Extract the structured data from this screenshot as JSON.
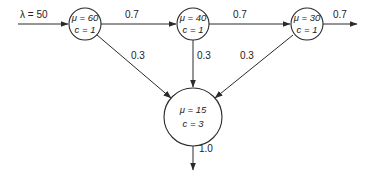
{
  "diagram": {
    "type": "queueing-network",
    "arrival": {
      "label": "λ = 50"
    },
    "nodes": [
      {
        "id": "n1",
        "mu": "μ = 60",
        "c": "c = 1"
      },
      {
        "id": "n2",
        "mu": "μ = 40",
        "c": "c = 1"
      },
      {
        "id": "n3",
        "mu": "μ = 30",
        "c": "c = 1"
      },
      {
        "id": "n4",
        "mu": "μ = 15",
        "c": "c = 3"
      }
    ],
    "edges": [
      {
        "from": "n1",
        "to": "n2",
        "label": "0.7"
      },
      {
        "from": "n2",
        "to": "n3",
        "label": "0.7"
      },
      {
        "from": "n3",
        "to": "exit",
        "label": "0.7"
      },
      {
        "from": "n1",
        "to": "n4",
        "label": "0.3"
      },
      {
        "from": "n2",
        "to": "n4",
        "label": "0.3"
      },
      {
        "from": "n3",
        "to": "n4",
        "label": "0.3"
      },
      {
        "from": "n4",
        "to": "exit",
        "label": "1.0"
      }
    ]
  }
}
